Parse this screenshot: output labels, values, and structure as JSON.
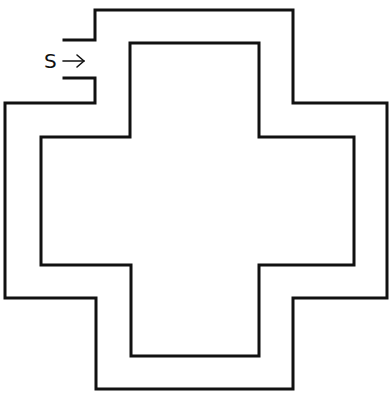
{
  "diagram": {
    "type": "cross-shaped corridor / maze outline",
    "start_label": "S",
    "start_arrow": "→",
    "colors": {
      "line": "#111111",
      "background": "#ffffff"
    }
  }
}
